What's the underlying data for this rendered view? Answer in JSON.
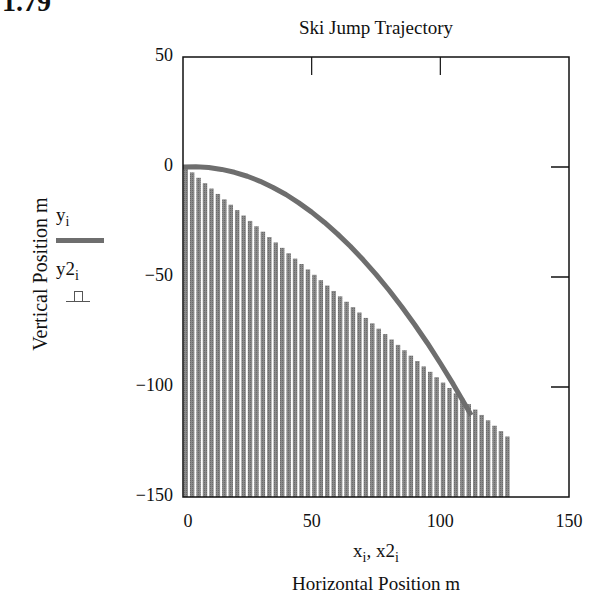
{
  "figure_number": "1.79",
  "chart_data": {
    "type": "line+bar",
    "title": "Ski Jump Trajectory",
    "xlabel_variables": [
      "x",
      "x2"
    ],
    "xlabel_subscript": "i",
    "xlabel": "Horizontal Position m",
    "ylabel": "Vertical Position m",
    "xlim": [
      0,
      150
    ],
    "ylim": [
      -150,
      50
    ],
    "xticks": [
      0,
      50,
      100,
      150
    ],
    "yticks": [
      50,
      0,
      -50,
      -100,
      -150
    ],
    "grid": false,
    "legend_position": "left",
    "series": [
      {
        "name": "y_i",
        "label": "y",
        "subscript": "i",
        "type": "line",
        "color": "#6e6e6e",
        "x": [
          0,
          5,
          10,
          15,
          20,
          25,
          30,
          35,
          40,
          45,
          50,
          55,
          60,
          65,
          70,
          75,
          80,
          85,
          90,
          95,
          100,
          105,
          110,
          112
        ],
        "y": [
          0,
          0.1,
          -0.2,
          -1.1,
          -2.4,
          -4.2,
          -6.5,
          -9.3,
          -12.5,
          -16.3,
          -20.5,
          -25.2,
          -30.4,
          -36.0,
          -42.2,
          -48.8,
          -55.9,
          -63.5,
          -71.6,
          -80.1,
          -89.2,
          -98.7,
          -108.7,
          -112.8
        ]
      },
      {
        "name": "y2_i",
        "label": "y2",
        "subscript": "i",
        "type": "bar",
        "color": "#858585",
        "x_start": 0,
        "x_end": 125,
        "x_step": 2.5,
        "slope": -0.98,
        "y_at_x0": 0,
        "y_at_xend": -123
      }
    ]
  }
}
